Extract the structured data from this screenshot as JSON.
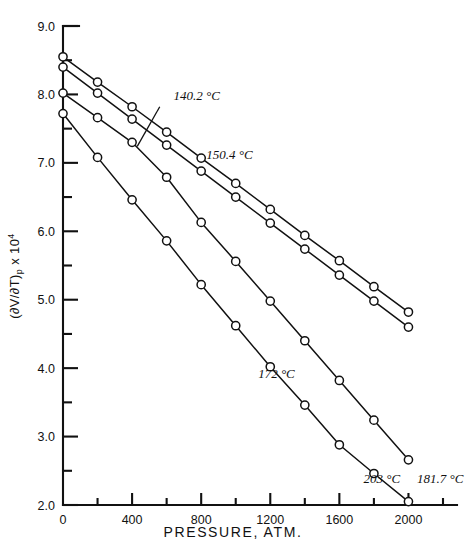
{
  "chart_data": {
    "type": "line",
    "title": "",
    "xlabel": "PRESSURE,  ATM.",
    "ylabel_text": "(∂V/∂T)",
    "ylabel_sub": "p",
    "ylabel_tail": " x 10",
    "ylabel_sup": "4",
    "xlim": [
      0,
      2200
    ],
    "ylim": [
      2.0,
      9.0
    ],
    "xticks": [
      0,
      400,
      800,
      1200,
      1600,
      2000
    ],
    "xticklabels": [
      "0",
      "400",
      "800",
      "1200",
      "1600",
      "2000"
    ],
    "xminorticks": [
      200,
      600,
      1000,
      1400,
      1800,
      2200
    ],
    "yticks": [
      2.0,
      3.0,
      4.0,
      5.0,
      6.0,
      7.0,
      8.0,
      9.0
    ],
    "yticklabels": [
      "2.0",
      "3.0",
      "4.0",
      "5.0",
      "6.0",
      "7.0",
      "8.0",
      "9.0"
    ],
    "yminorticks": [
      2.5,
      3.5,
      4.5,
      5.5,
      6.5,
      7.5,
      8.5
    ],
    "grid": false,
    "legend_position": "inline-annotations",
    "marker": "open-circle",
    "series": [
      {
        "name": "140.2 °C",
        "label": "140.2 °C",
        "label_x": 640,
        "label_y": 7.92,
        "leader_from_x": 560,
        "leader_from_y": 7.82,
        "leader_to_x": 430,
        "leader_to_y": 7.24,
        "x": [
          0,
          200,
          400,
          600,
          800,
          1000,
          1200,
          1400,
          1600,
          1800,
          2000
        ],
        "y": [
          8.55,
          8.18,
          7.82,
          7.45,
          7.07,
          6.7,
          6.32,
          5.94,
          5.57,
          5.19,
          4.82
        ]
      },
      {
        "name": "150.4 °C",
        "label": "150.4 °C",
        "label_x": 830,
        "label_y": 7.05,
        "leader_from_x": 0,
        "leader_from_y": 0,
        "leader_to_x": 0,
        "leader_to_y": 0,
        "x": [
          0,
          200,
          400,
          600,
          800,
          1000,
          1200,
          1400,
          1600,
          1800,
          2000
        ],
        "y": [
          8.4,
          8.02,
          7.64,
          7.26,
          6.88,
          6.5,
          6.12,
          5.74,
          5.36,
          4.98,
          4.6
        ]
      },
      {
        "name": "172 °C",
        "label": "172 °C",
        "label_x": 1130,
        "label_y": 3.86,
        "leader_from_x": 0,
        "leader_from_y": 0,
        "leader_to_x": 0,
        "leader_to_y": 0,
        "x": [
          0,
          200,
          400,
          600,
          800,
          1000,
          1200,
          1400,
          1600,
          1800,
          2000
        ],
        "y": [
          8.02,
          7.66,
          7.3,
          6.79,
          6.13,
          5.56,
          4.98,
          4.4,
          3.82,
          3.24,
          2.66
        ]
      },
      {
        "name": "203 °C",
        "label": "203 °C",
        "label_x": 1740,
        "label_y": 2.32,
        "leader_from_x": 0,
        "leader_from_y": 0,
        "leader_to_x": 0,
        "leader_to_y": 0,
        "x": [
          0,
          200,
          400,
          600,
          800,
          1000,
          1200,
          1400,
          1600,
          1800,
          2000
        ],
        "y": [
          7.72,
          7.08,
          6.46,
          5.86,
          5.22,
          4.62,
          4.02,
          3.46,
          2.88,
          2.46,
          2.05
        ]
      },
      {
        "name": "181.7 °C",
        "label": "181.7 °C",
        "label_x": 2050,
        "label_y": 2.32,
        "leader_from_x": 0,
        "leader_from_y": 0,
        "leader_to_x": 0,
        "leader_to_y": 0,
        "x": [],
        "y": []
      }
    ]
  },
  "axes": {
    "line_color": "#111111",
    "marker_face": "#ffffff"
  }
}
